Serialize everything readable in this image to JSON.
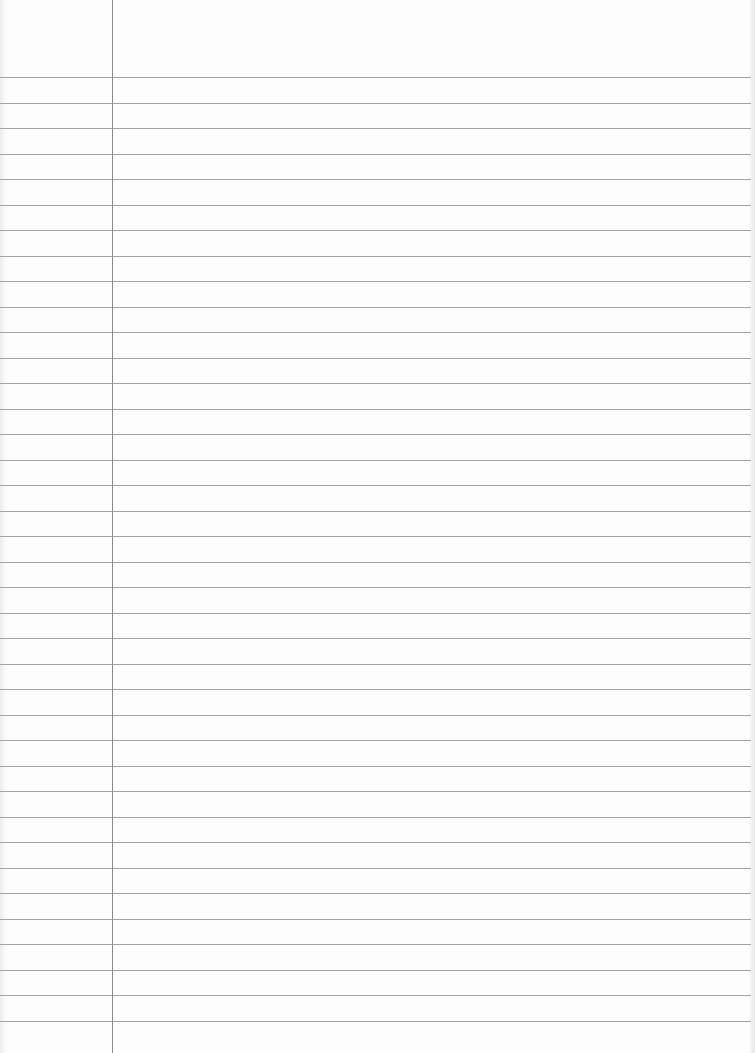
{
  "page": {
    "type": "ruled-notebook-paper",
    "width": 755,
    "height": 1053,
    "background_color": "#fdfdfd",
    "text_content": []
  },
  "rules": {
    "color": "#a4a4a4",
    "first_line_y": 77,
    "spacing": 25.5,
    "count": 38,
    "right_end_x": 751
  },
  "margin": {
    "x": 112,
    "color": "#8c8c8c"
  }
}
